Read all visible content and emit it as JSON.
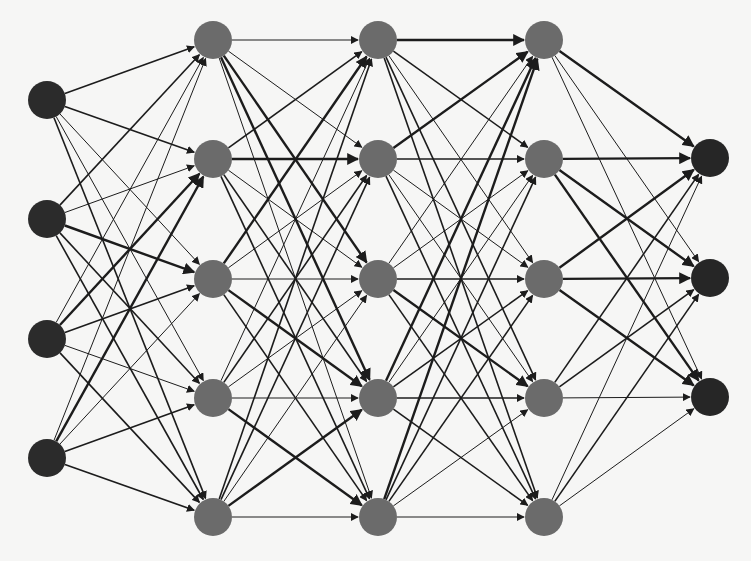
{
  "diagram": {
    "type": "feedforward-neural-network",
    "colors": {
      "background": "#f6f6f5",
      "input_node": "#2b2b2b",
      "hidden_node": "#6b6b6b",
      "output_node": "#262626",
      "edge": "#1c1c1c"
    },
    "node_radius": 19,
    "layers": [
      {
        "name": "input",
        "role": "input",
        "x": 47,
        "ys": [
          100,
          219,
          339,
          458
        ]
      },
      {
        "name": "hidden-1",
        "role": "hidden",
        "x": 213,
        "ys": [
          40,
          159,
          279,
          398,
          517
        ]
      },
      {
        "name": "hidden-2",
        "role": "hidden",
        "x": 378,
        "ys": [
          40,
          159,
          279,
          398,
          517
        ]
      },
      {
        "name": "hidden-3",
        "role": "hidden",
        "x": 544,
        "ys": [
          40,
          159,
          279,
          398,
          517
        ]
      },
      {
        "name": "output",
        "role": "output",
        "x": 710,
        "ys": [
          158,
          278,
          397
        ]
      }
    ],
    "edge_widths": {
      "thin": 1.0,
      "medium": 1.6,
      "thick": 2.4
    },
    "connections": "fully-connected between consecutive layers, directed left-to-right with arrowheads"
  }
}
